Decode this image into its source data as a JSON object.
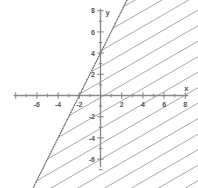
{
  "chart_data": {
    "type": "line",
    "title": "",
    "subtitle": "",
    "xlabel": "x",
    "ylabel": "y",
    "xlim": [
      -8,
      8
    ],
    "ylim": [
      -7,
      8
    ],
    "grid": false,
    "legend": null,
    "x_ticks": [
      -8,
      -6,
      -4,
      -2,
      0,
      2,
      4,
      6,
      8
    ],
    "y_ticks": [
      8,
      6,
      4,
      2,
      0,
      -2,
      -4,
      -6
    ],
    "x_tick_labels": [
      "",
      "-6",
      "-4",
      "-2",
      "",
      "2",
      "4",
      "6",
      "8"
    ],
    "y_tick_labels": [
      "8",
      "6",
      "4",
      "2",
      "",
      "-2",
      "-4",
      "-6"
    ],
    "x_minor_tick_step": 1,
    "y_minor_tick_step": 1,
    "series": [
      {
        "name": "boundary",
        "type": "line",
        "style": "dotted",
        "equation": "y = 2x + 4",
        "slope": 2,
        "y_intercept": 4,
        "x_intercept": -2,
        "inclusive": false,
        "points": [
          [
            -5.5,
            -7
          ],
          [
            2,
            8
          ]
        ],
        "color": "#6e6e6e"
      }
    ],
    "shaded_region": {
      "name": "solution-region",
      "inequality": "y < 2x + 4",
      "side": "right-below",
      "fill": "diagonal-hatch",
      "hatch_angle_degrees": -30,
      "color": "#9a9a9a"
    },
    "annotations": [
      {
        "label": "y",
        "position": "y-axis-top"
      },
      {
        "label": "x",
        "position": "x-axis-right"
      }
    ]
  },
  "axes": {
    "x_axis_name": "x",
    "y_axis_name": "y",
    "x_labels": [
      {
        "value": -6,
        "text": "-6"
      },
      {
        "value": -4,
        "text": "-4"
      },
      {
        "value": -2,
        "text": "-2"
      },
      {
        "value": 2,
        "text": "2"
      },
      {
        "value": 4,
        "text": "4"
      },
      {
        "value": 6,
        "text": "6"
      },
      {
        "value": 8,
        "text": "8"
      }
    ],
    "y_labels": [
      {
        "value": 8,
        "text": "8"
      },
      {
        "value": 6,
        "text": "6"
      },
      {
        "value": 4,
        "text": "4"
      },
      {
        "value": 2,
        "text": "2"
      },
      {
        "value": -2,
        "text": "-2"
      },
      {
        "value": -4,
        "text": "-4"
      },
      {
        "value": -6,
        "text": "-6"
      }
    ]
  },
  "colors": {
    "axis": "#8a8a8a",
    "text": "#555555",
    "boundary": "#6e6e6e",
    "hatch": "#9a9a9a",
    "background": "#ffffff"
  }
}
